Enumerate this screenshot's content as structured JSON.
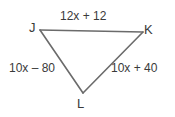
{
  "figure": {
    "type": "triangle",
    "background_color": "#ffffff",
    "stroke_color": "#6b6b6b",
    "text_color": "#3a3a3a",
    "vertices": [
      {
        "name": "J",
        "label": "J",
        "x": 40,
        "y": 30
      },
      {
        "name": "K",
        "label": "K",
        "x": 143,
        "y": 32
      },
      {
        "name": "L",
        "label": "L",
        "x": 83,
        "y": 93
      }
    ],
    "sides": [
      {
        "name": "JK",
        "label": "12x + 12"
      },
      {
        "name": "JL",
        "label": "10x – 80"
      },
      {
        "name": "KL",
        "label": "10x + 40"
      }
    ]
  }
}
